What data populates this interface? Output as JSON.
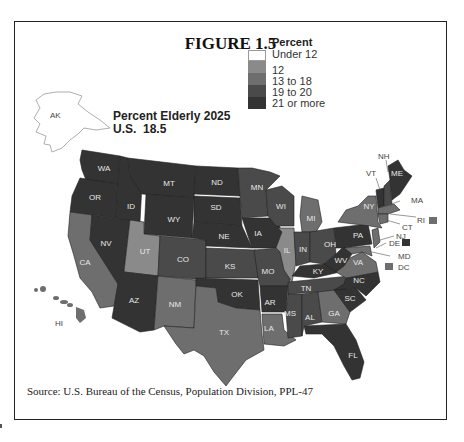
{
  "figure": {
    "title": "FIGURE 1.5",
    "map_title": "Percent Elderly 2025",
    "us_value_label": "U.S.  18.5",
    "source": "Source: U.S. Bureau of the Census, Population Division, PPL-47"
  },
  "legend": {
    "heading": "Percent",
    "items": [
      {
        "label": "Under 12",
        "color": "#ffffff"
      },
      {
        "label": "12",
        "color": "#8a8a8a"
      },
      {
        "label": "13 to 18",
        "color": "#6e6e6e"
      },
      {
        "label": "19 to 20",
        "color": "#4a4a4a"
      },
      {
        "label": "21 or more",
        "color": "#333333"
      }
    ]
  },
  "states": {
    "AK": {
      "label": "AK",
      "category": "Under 12"
    },
    "HI": {
      "label": "HI",
      "category": "13 to 18"
    },
    "WA": {
      "label": "WA",
      "category": "21 or more"
    },
    "OR": {
      "label": "OR",
      "category": "21 or more"
    },
    "CA": {
      "label": "CA",
      "category": "13 to 18"
    },
    "NV": {
      "label": "NV",
      "category": "21 or more"
    },
    "ID": {
      "label": "ID",
      "category": "21 or more"
    },
    "MT": {
      "label": "MT",
      "category": "21 or more"
    },
    "WY": {
      "label": "WY",
      "category": "21 or more"
    },
    "UT": {
      "label": "UT",
      "category": "12"
    },
    "AZ": {
      "label": "AZ",
      "category": "21 or more"
    },
    "CO": {
      "label": "CO",
      "category": "19 to 20"
    },
    "NM": {
      "label": "NM",
      "category": "13 to 18"
    },
    "ND": {
      "label": "ND",
      "category": "21 or more"
    },
    "SD": {
      "label": "SD",
      "category": "21 or more"
    },
    "NE": {
      "label": "NE",
      "category": "21 or more"
    },
    "KS": {
      "label": "KS",
      "category": "19 to 20"
    },
    "OK": {
      "label": "OK",
      "category": "21 or more"
    },
    "TX": {
      "label": "TX",
      "category": "13 to 18"
    },
    "MN": {
      "label": "MN",
      "category": "19 to 20"
    },
    "IA": {
      "label": "IA",
      "category": "21 or more"
    },
    "MO": {
      "label": "MO",
      "category": "19 to 20"
    },
    "AR": {
      "label": "AR",
      "category": "21 or more"
    },
    "LA": {
      "label": "LA",
      "category": "13 to 18"
    },
    "WI": {
      "label": "WI",
      "category": "19 to 20"
    },
    "IL": {
      "label": "IL",
      "category": "12"
    },
    "MI": {
      "label": "MI",
      "category": "13 to 18"
    },
    "IN": {
      "label": "IN",
      "category": "19 to 20"
    },
    "OH": {
      "label": "OH",
      "category": "19 to 20"
    },
    "KY": {
      "label": "KY",
      "category": "21 or more"
    },
    "TN": {
      "label": "TN",
      "category": "19 to 20"
    },
    "MS": {
      "label": "MS",
      "category": "19 to 20"
    },
    "AL": {
      "label": "AL",
      "category": "19 to 20"
    },
    "GA": {
      "label": "GA",
      "category": "13 to 18"
    },
    "FL": {
      "label": "FL",
      "category": "21 or more"
    },
    "SC": {
      "label": "SC",
      "category": "21 or more"
    },
    "NC": {
      "label": "NC",
      "category": "21 or more"
    },
    "VA": {
      "label": "VA",
      "category": "13 to 18"
    },
    "WV": {
      "label": "WV",
      "category": "21 or more"
    },
    "PA": {
      "label": "PA",
      "category": "21 or more"
    },
    "NY": {
      "label": "NY",
      "category": "13 to 18"
    },
    "VT": {
      "label": "VT",
      "category": "21 or more"
    },
    "NH": {
      "label": "NH",
      "category": "19 to 20"
    },
    "ME": {
      "label": "ME",
      "category": "21 or more"
    },
    "MA": {
      "label": "MA",
      "category": "13 to 18"
    },
    "RI": {
      "label": "RI",
      "category": "13 to 18"
    },
    "CT": {
      "label": "CT",
      "category": "13 to 18"
    },
    "NJ": {
      "label": "NJ",
      "category": "13 to 18"
    },
    "DE": {
      "label": "DE",
      "category": "21 or more"
    },
    "MD": {
      "label": "MD",
      "category": "13 to 18"
    },
    "DC": {
      "label": "DC",
      "category": "13 to 18"
    }
  }
}
